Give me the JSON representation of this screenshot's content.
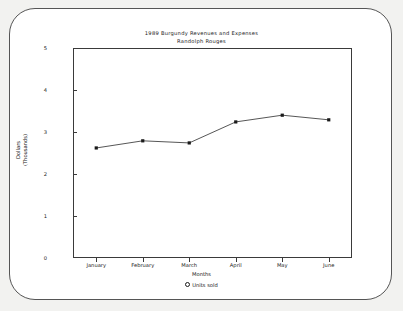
{
  "chart_data": {
    "type": "line",
    "title": "1989 Burgundy Revenues and Expenses",
    "subtitle": "Randolph Rouges",
    "xlabel": "Months",
    "ylabel_line1": "Dollars",
    "ylabel_line2": "(Thousands)",
    "categories": [
      "January",
      "February",
      "March",
      "April",
      "May",
      "June"
    ],
    "yticks": [
      "0",
      "1",
      "2",
      "3",
      "4",
      "5"
    ],
    "ylim": [
      0,
      5
    ],
    "grid": false,
    "legend_position": "bottom",
    "legend": [
      {
        "name": "Units sold",
        "marker": "filled-square-marker"
      }
    ],
    "series": [
      {
        "name": "Units sold",
        "values": [
          2.62,
          2.79,
          2.74,
          3.24,
          3.4,
          3.29
        ]
      }
    ]
  }
}
